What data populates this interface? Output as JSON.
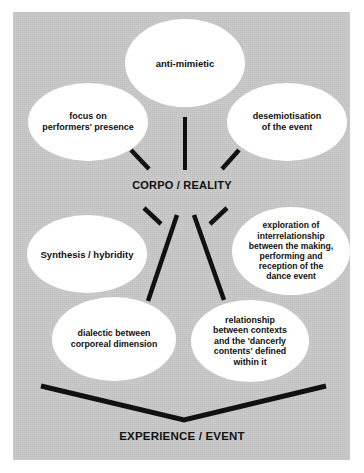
{
  "figure": {
    "kind": "concept-diagram",
    "panel_color": "#c7c7c7",
    "node_fill": "#ffffff",
    "line_color": "#111111",
    "text_color": "#111111"
  },
  "hub": {
    "label": "CORPO / REALITY"
  },
  "base": {
    "label": "EXPERIENCE / EVENT"
  },
  "nodes": [
    {
      "id": "anti-mimietic",
      "label": "anti-mimietic"
    },
    {
      "id": "focus-performers",
      "label": "focus on\nperformers' presence"
    },
    {
      "id": "desemiotisation",
      "label": "desemiotisation\nof the event"
    },
    {
      "id": "synthesis",
      "label": "Synthesis / hybridity"
    },
    {
      "id": "exploration",
      "label": "exploration of\ninterrelationship\nbetween the making,\nperforming and\nreception of the\ndance event"
    },
    {
      "id": "dialectic",
      "label": "dialectic between\ncorporeal dimension"
    },
    {
      "id": "relationship",
      "label": "relationship\nbetween contexts\nand the 'dancerly\ncontents' defined\nwithin it"
    }
  ],
  "connectors": [
    {
      "id": "hub-to-anti-mimietic",
      "x1": 185,
      "y1": 117,
      "x2": 185,
      "y2": 170,
      "width": 4
    },
    {
      "id": "hub-to-focus-performers",
      "x1": 131,
      "y1": 150,
      "x2": 149,
      "y2": 169,
      "width": 4.5
    },
    {
      "id": "hub-to-desemiotisation",
      "x1": 239,
      "y1": 150,
      "x2": 222,
      "y2": 169,
      "width": 4.5
    },
    {
      "id": "hub-to-synthesis",
      "x1": 144,
      "y1": 208,
      "x2": 161,
      "y2": 224,
      "width": 4.5
    },
    {
      "id": "hub-to-exploration",
      "x1": 227,
      "y1": 208,
      "x2": 210,
      "y2": 224,
      "width": 4.5
    },
    {
      "id": "hub-to-dialectic",
      "x1": 177,
      "y1": 215,
      "x2": 148,
      "y2": 301,
      "width": 4.5
    },
    {
      "id": "hub-to-relationship",
      "x1": 194,
      "y1": 215,
      "x2": 224,
      "y2": 300,
      "width": 4.5
    }
  ],
  "base_connector": {
    "id": "base-v-connector",
    "points": "41,386 184,420 326,386",
    "width": 5
  }
}
